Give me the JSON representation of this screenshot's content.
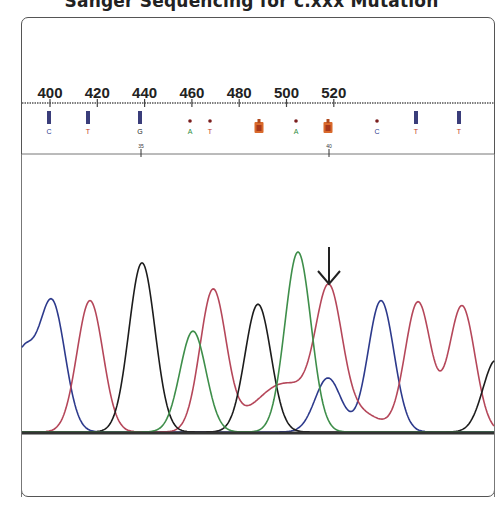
{
  "title": "Sanger Sequencing for c.xxx Mutation",
  "chart_data": {
    "type": "line",
    "title": "Sanger Sequencing for c.xxx Mutation",
    "xlabel": "",
    "ylabel": "",
    "ruler_ticks": [
      400,
      420,
      440,
      460,
      480,
      500,
      520
    ],
    "base_index_ticks": [
      35,
      40
    ],
    "base_calls": [
      {
        "base": "C",
        "color": "#2d3a8c",
        "x": 49,
        "quality": "high"
      },
      {
        "base": "T",
        "color": "#c0392b",
        "x": 88,
        "quality": "high"
      },
      {
        "base": "G",
        "color": "#222222",
        "x": 140,
        "quality": "high"
      },
      {
        "base": "A",
        "color": "#2e8b3a",
        "x": 190,
        "quality": "low"
      },
      {
        "base": "T",
        "color": "#c0392b",
        "x": 210,
        "quality": "low"
      },
      {
        "base": "R",
        "color": "#d9692b",
        "x": 259,
        "quality": "ambiguous"
      },
      {
        "base": "A",
        "color": "#2e8b3a",
        "x": 296,
        "quality": "low"
      },
      {
        "base": "R",
        "color": "#d9692b",
        "x": 328,
        "quality": "ambiguous"
      },
      {
        "base": "C",
        "color": "#2d3a8c",
        "x": 377,
        "quality": "low"
      },
      {
        "base": "T",
        "color": "#c0392b",
        "x": 416,
        "quality": "high"
      },
      {
        "base": "T",
        "color": "#c0392b",
        "x": 459,
        "quality": "high"
      }
    ],
    "series": [
      {
        "name": "C (blue)",
        "color": "#2d3a8c",
        "peaks": [
          {
            "x": 52,
            "height": 0.72
          },
          {
            "x": 328,
            "height": 0.3
          },
          {
            "x": 381,
            "height": 0.73
          }
        ]
      },
      {
        "name": "T (red)",
        "color": "#b5475a",
        "peaks": [
          {
            "x": 90,
            "height": 0.73
          },
          {
            "x": 213,
            "height": 0.78
          },
          {
            "x": 329,
            "height": 0.7
          },
          {
            "x": 418,
            "height": 0.72
          },
          {
            "x": 462,
            "height": 0.7
          }
        ]
      },
      {
        "name": "G (black)",
        "color": "#1c1c1c",
        "peaks": [
          {
            "x": 142,
            "height": 0.94
          },
          {
            "x": 258,
            "height": 0.71
          },
          {
            "x": 496,
            "height": 0.4
          }
        ]
      },
      {
        "name": "A (green)",
        "color": "#3e8e4a",
        "peaks": [
          {
            "x": 193,
            "height": 0.56
          },
          {
            "x": 298,
            "height": 1.0
          }
        ]
      }
    ],
    "annotation": {
      "type": "arrow",
      "x": 329,
      "label": "mutation site (heterozygous)"
    }
  }
}
